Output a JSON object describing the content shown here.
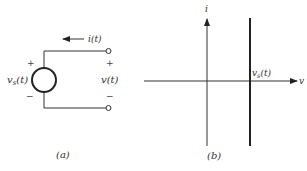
{
  "figure_a": {
    "caption": "(a)",
    "source_label": "v",
    "source_subscript": "s",
    "source_arg": "(t)",
    "source_plus": "+",
    "source_minus": "−",
    "current_label": "i(t)",
    "terminal_label": "v(t)",
    "terminal_plus": "+",
    "terminal_minus": "−"
  },
  "figure_b": {
    "caption": "(b)",
    "y_axis_label": "i",
    "x_axis_label": "v",
    "line_label_main": "v",
    "line_label_sub": "s",
    "line_label_arg": "(t)"
  },
  "colors": {
    "stroke": "#222222",
    "background": "#ffffff"
  }
}
